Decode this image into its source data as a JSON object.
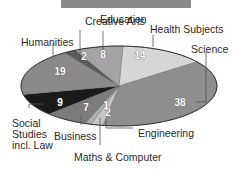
{
  "chart_data": {
    "type": "pie",
    "title": "",
    "categories": [
      "Health Subjects",
      "Science",
      "Engineering",
      "Maths & Computer",
      "Business",
      "Social Studies incl. Law",
      "Humanities",
      "Creative Arts",
      "Education"
    ],
    "values": [
      14,
      38,
      2,
      1,
      7,
      9,
      19,
      2,
      8
    ],
    "unit": "%",
    "colors": [
      "#d6d6d6",
      "#8e8e8e",
      "#c4c4c4",
      "#b0b0b0",
      "#7c7c7c",
      "#1a1a1a",
      "#8a8a8a",
      "#5a5a5a",
      "#a4a4a4"
    ],
    "legend": "leader-line labels"
  },
  "labels": {
    "health": "Health Subjects",
    "science": "Science",
    "engineering": "Engineering",
    "maths": "Maths & Computer",
    "business": "Business",
    "social_1": "Social",
    "social_2": "Studies",
    "social_3": "incl. Law",
    "humanities": "Humanities",
    "creative": "Creative Arts",
    "education": "Education"
  },
  "values": {
    "health": "14",
    "science": "38",
    "engineering": "2",
    "maths": "1",
    "business": "7",
    "social": "9",
    "humanities": "19",
    "creative": "2",
    "education": "8"
  }
}
